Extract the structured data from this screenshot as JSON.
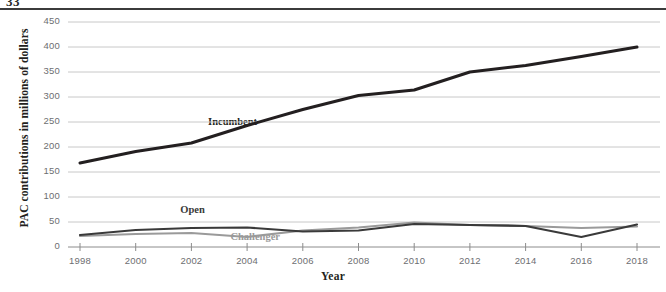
{
  "figure": {
    "page_stub": "33",
    "rule_color": "#3b3b3b",
    "background": "#ffffff"
  },
  "chart_data": {
    "type": "line",
    "title": "",
    "subtitle": "",
    "xlabel": "Year",
    "ylabel": "PAC contributions in millions of dollars",
    "x": [
      1998,
      2000,
      2002,
      2004,
      2006,
      2008,
      2010,
      2012,
      2014,
      2016,
      2018
    ],
    "xtick_labels": [
      "1998",
      "2000",
      "2002",
      "2004",
      "2006",
      "2008",
      "2010",
      "2012",
      "2014",
      "2016",
      "2018"
    ],
    "ytick_labels": [
      "0",
      "50",
      "100",
      "150",
      "200",
      "250",
      "300",
      "350",
      "400",
      "450"
    ],
    "ytick_values": [
      0,
      50,
      100,
      150,
      200,
      250,
      300,
      350,
      400,
      450
    ],
    "xlim": [
      1998,
      2018
    ],
    "ylim": [
      0,
      450
    ],
    "grid": "horizontal",
    "legend_position": "inline-annotations",
    "series": [
      {
        "name": "Incumbent",
        "color": "#231f20",
        "width": 3.0,
        "values": [
          168,
          191,
          208,
          243,
          275,
          303,
          314,
          350,
          363,
          381,
          400
        ],
        "annotation": {
          "text": "Incumbent",
          "x": 2002.6,
          "y": 248
        }
      },
      {
        "name": "Open",
        "color": "#3a3a3a",
        "width": 2.2,
        "values": [
          24,
          34,
          38,
          39,
          31,
          33,
          46,
          44,
          42,
          20,
          45
        ],
        "annotation": {
          "text": "Open",
          "x": 2001.6,
          "y": 72
        }
      },
      {
        "name": "Challenger",
        "color": "#9a9a9a",
        "width": 2.2,
        "values": [
          22,
          26,
          28,
          20,
          33,
          39,
          49,
          44,
          42,
          38,
          41
        ],
        "annotation": {
          "text": "Challenger",
          "x": 2003.4,
          "y": 18
        }
      }
    ],
    "axis_color": "#8c8c8c",
    "grid_color": "#c8c8c8",
    "tick_color": "#6d6e71"
  }
}
